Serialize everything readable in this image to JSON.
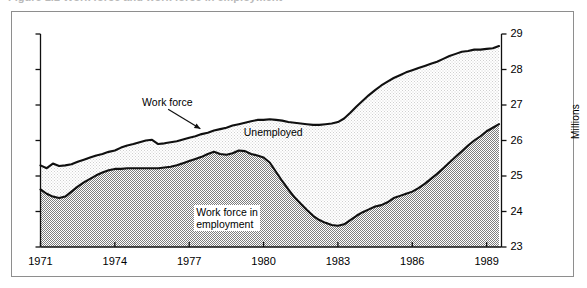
{
  "figure": {
    "caption_clipped": "Figure 1.1   Work force and work force in employment",
    "frame_color": "#8e8e8e"
  },
  "chart_data": {
    "type": "area",
    "title": "",
    "subtitle": "",
    "xlabel": "",
    "ylabel": "Millions",
    "ylim": [
      23,
      29
    ],
    "xlim": [
      1971,
      1989.6
    ],
    "ytick_labels": [
      "23",
      "24",
      "25",
      "26",
      "27",
      "28",
      "29"
    ],
    "yticks": [
      23,
      24,
      25,
      26,
      27,
      28,
      29
    ],
    "xtick_labels": [
      "1971",
      "1974",
      "1977",
      "1980",
      "1983",
      "1986",
      "1989"
    ],
    "xticks": [
      1971,
      1974,
      1977,
      1980,
      1983,
      1986,
      1989
    ],
    "grid": false,
    "legend_position": "in-plot annotations",
    "annotations": [
      {
        "name": "work-force-label",
        "text": "Work force",
        "x": 1975.1,
        "y": 27.05,
        "leader": true
      },
      {
        "name": "unemployed-label",
        "text": "Unemployed",
        "x": 1979.2,
        "y": 26.2,
        "leader": false
      },
      {
        "name": "work-force-in-employment-label",
        "line1": "Work force in",
        "line2": "employment",
        "x": 1977.2,
        "y": 24.0,
        "leader": false
      }
    ],
    "colors": {
      "line": "#101010",
      "unemployed_band": "#eeeeee",
      "employment_band": "#b2b2b2",
      "axis": "#101010"
    },
    "series": [
      {
        "name": "Work force",
        "fill": "unemployed_band",
        "x": [
          1971.0,
          1971.25,
          1971.5,
          1971.75,
          1972.0,
          1972.25,
          1972.5,
          1972.75,
          1973.0,
          1973.25,
          1973.5,
          1973.75,
          1974.0,
          1974.25,
          1974.5,
          1974.75,
          1975.0,
          1975.25,
          1975.5,
          1975.75,
          1976.0,
          1976.25,
          1976.5,
          1976.75,
          1977.0,
          1977.25,
          1977.5,
          1977.75,
          1978.0,
          1978.25,
          1978.5,
          1978.75,
          1979.0,
          1979.25,
          1979.5,
          1979.75,
          1980.0,
          1980.25,
          1980.5,
          1980.75,
          1981.0,
          1981.25,
          1981.5,
          1981.75,
          1982.0,
          1982.25,
          1982.5,
          1982.75,
          1983.0,
          1983.25,
          1983.5,
          1983.75,
          1984.0,
          1984.25,
          1984.5,
          1984.75,
          1985.0,
          1985.25,
          1985.5,
          1985.75,
          1986.0,
          1986.25,
          1986.5,
          1986.75,
          1987.0,
          1987.25,
          1987.5,
          1987.75,
          1988.0,
          1988.25,
          1988.5,
          1988.75,
          1989.0,
          1989.25,
          1989.5
        ],
        "y": [
          25.3,
          25.22,
          25.35,
          25.28,
          25.3,
          25.33,
          25.4,
          25.46,
          25.52,
          25.58,
          25.62,
          25.68,
          25.72,
          25.8,
          25.86,
          25.9,
          25.95,
          26.0,
          26.02,
          25.9,
          25.92,
          25.95,
          25.98,
          26.03,
          26.08,
          26.12,
          26.18,
          26.22,
          26.28,
          26.32,
          26.36,
          26.42,
          26.46,
          26.5,
          26.54,
          26.58,
          26.58,
          26.6,
          26.58,
          26.56,
          26.52,
          26.5,
          26.48,
          26.46,
          26.44,
          26.44,
          26.46,
          26.48,
          26.52,
          26.62,
          26.78,
          26.96,
          27.12,
          27.28,
          27.42,
          27.55,
          27.66,
          27.76,
          27.84,
          27.92,
          27.98,
          28.04,
          28.1,
          28.16,
          28.22,
          28.3,
          28.38,
          28.44,
          28.5,
          28.52,
          28.56,
          28.56,
          28.58,
          28.6,
          28.66
        ]
      },
      {
        "name": "Work force in employment",
        "fill": "employment_band",
        "x": [
          1971.0,
          1971.25,
          1971.5,
          1971.75,
          1972.0,
          1972.25,
          1972.5,
          1972.75,
          1973.0,
          1973.25,
          1973.5,
          1973.75,
          1974.0,
          1974.25,
          1974.5,
          1974.75,
          1975.0,
          1975.25,
          1975.5,
          1975.75,
          1976.0,
          1976.25,
          1976.5,
          1976.75,
          1977.0,
          1977.25,
          1977.5,
          1977.75,
          1978.0,
          1978.25,
          1978.5,
          1978.75,
          1979.0,
          1979.25,
          1979.5,
          1979.75,
          1980.0,
          1980.25,
          1980.5,
          1980.75,
          1981.0,
          1981.25,
          1981.5,
          1981.75,
          1982.0,
          1982.25,
          1982.5,
          1982.75,
          1983.0,
          1983.25,
          1983.5,
          1983.75,
          1984.0,
          1984.25,
          1984.5,
          1984.75,
          1985.0,
          1985.25,
          1985.5,
          1985.75,
          1986.0,
          1986.25,
          1986.5,
          1986.75,
          1987.0,
          1987.25,
          1987.5,
          1987.75,
          1988.0,
          1988.25,
          1988.5,
          1988.75,
          1989.0,
          1989.25,
          1989.5
        ],
        "y": [
          24.62,
          24.5,
          24.42,
          24.38,
          24.42,
          24.56,
          24.7,
          24.82,
          24.92,
          25.02,
          25.1,
          25.16,
          25.2,
          25.2,
          25.22,
          25.22,
          25.22,
          25.22,
          25.22,
          25.22,
          25.24,
          25.26,
          25.3,
          25.36,
          25.42,
          25.48,
          25.54,
          25.62,
          25.68,
          25.62,
          25.6,
          25.64,
          25.72,
          25.7,
          25.62,
          25.58,
          25.52,
          25.38,
          25.12,
          24.86,
          24.62,
          24.4,
          24.22,
          24.04,
          23.88,
          23.76,
          23.68,
          23.62,
          23.6,
          23.64,
          23.76,
          23.88,
          23.98,
          24.06,
          24.14,
          24.18,
          24.26,
          24.38,
          24.44,
          24.5,
          24.56,
          24.66,
          24.78,
          24.92,
          25.06,
          25.22,
          25.38,
          25.54,
          25.7,
          25.86,
          26.0,
          26.12,
          26.26,
          26.36,
          26.46
        ]
      }
    ]
  }
}
